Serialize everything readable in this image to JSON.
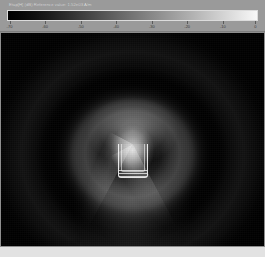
{
  "colorbar": {
    "title": "Etap[H] (dB) Reference value: 1.52e03 A/m",
    "min_color": "#000000",
    "max_color": "#f8f8f8",
    "scale": "grayscale",
    "tick_labels": [
      "-70",
      "-60",
      "-50",
      "-40",
      "-30",
      "-20",
      "-10",
      "0"
    ],
    "tick_positions_pct": [
      1,
      15.2,
      29.4,
      43.5,
      57.7,
      71.8,
      86,
      99
    ]
  },
  "plot": {
    "field_label": "near-field magnitude",
    "structure_label": "waveguide-aperture"
  },
  "chart_data": {
    "type": "heatmap",
    "title": "Etap[H] (dB) Reference value: 1.52e03 A/m",
    "xlabel": "",
    "ylabel": "",
    "colormap": "grayscale",
    "colorbar_range": [
      -70,
      0
    ],
    "colorbar_unit": "dB",
    "colorbar_ticks": [
      -70,
      -60,
      -50,
      -40,
      -30,
      -20,
      -10,
      0
    ],
    "grid": false,
    "legend_position": "top",
    "source_center_norm": [
      0.5,
      0.52
    ],
    "radial_profile": {
      "note": "Field level in dB versus normalized radius from the source center.",
      "radius_norm": [
        0.0,
        0.05,
        0.1,
        0.15,
        0.2,
        0.25,
        0.3,
        0.35,
        0.4,
        0.45,
        0.5,
        0.55,
        0.6,
        0.65,
        0.7,
        0.75,
        0.8,
        0.85,
        0.9,
        0.95,
        1.0
      ],
      "level_db": [
        -4,
        -6,
        -10,
        -16,
        -24,
        -31,
        -38,
        -44,
        -50,
        -56,
        -62,
        -68,
        -58,
        -50,
        -46,
        -48,
        -54,
        -60,
        -65,
        -68,
        -70
      ]
    },
    "lobes": [
      {
        "name": "main lobe",
        "direction_deg": 90,
        "peak_db": -4,
        "radius_norm": 0.08
      },
      {
        "name": "upper sidelobe ring",
        "direction_deg": 90,
        "peak_db": -30,
        "radius_norm": 0.32
      },
      {
        "name": "first null ring",
        "direction_deg": 0,
        "peak_db": -70,
        "radius_norm": 0.56
      },
      {
        "name": "outer sidelobe ring",
        "direction_deg": 270,
        "peak_db": -50,
        "radius_norm": 0.72
      }
    ]
  }
}
